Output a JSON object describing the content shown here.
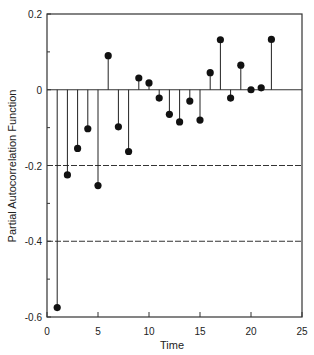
{
  "chart_data": {
    "type": "stem",
    "title": "",
    "xlabel": "Time",
    "ylabel": "Partial Autocorrelation Function",
    "xlim": [
      0,
      25
    ],
    "ylim": [
      -0.6,
      0.2
    ],
    "x_ticks": [
      0,
      5,
      10,
      15,
      20,
      25
    ],
    "x_tick_labels": [
      "0",
      "5",
      "10",
      "15",
      "20",
      "25"
    ],
    "y_ticks": [
      -0.6,
      -0.4,
      -0.2,
      0,
      0.2
    ],
    "y_tick_labels": [
      "-0.6",
      "-0.4",
      "-0.2",
      "0",
      "0.2"
    ],
    "y_minor_ticks": [
      -0.5,
      -0.3,
      -0.1,
      0.1
    ],
    "reference_lines": [
      {
        "y": 0,
        "style": "solid"
      },
      {
        "y": -0.2,
        "style": "dashed"
      },
      {
        "y": -0.4,
        "style": "dashed"
      }
    ],
    "series": [
      {
        "name": "PACF",
        "x": [
          1,
          2,
          3,
          4,
          5,
          6,
          7,
          8,
          9,
          10,
          11,
          12,
          13,
          14,
          15,
          16,
          17,
          18,
          19,
          20,
          21,
          22
        ],
        "values": [
          -0.575,
          -0.225,
          -0.155,
          -0.103,
          -0.253,
          0.09,
          -0.098,
          -0.163,
          0.031,
          0.018,
          -0.022,
          -0.065,
          -0.085,
          -0.03,
          -0.08,
          0.045,
          0.132,
          -0.022,
          0.065,
          0.0,
          0.005,
          0.133
        ]
      }
    ],
    "grid": false,
    "legend": null
  }
}
